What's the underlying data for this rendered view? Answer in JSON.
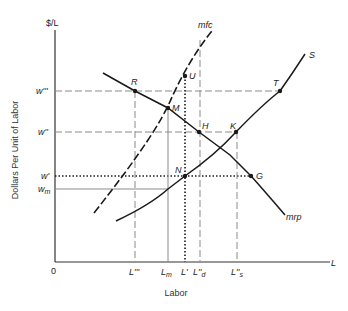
{
  "diagram": {
    "y_axis": {
      "unit_label": "$/L",
      "title": "Dollars Per Unit of Labor"
    },
    "x_axis": {
      "end_label": "L",
      "origin_label": "0",
      "title": "Labor"
    },
    "wage_ticks": [
      {
        "id": "w3",
        "label": "w'''",
        "y": 91
      },
      {
        "id": "w2",
        "label": "w''",
        "y": 132
      },
      {
        "id": "w1",
        "label": "w'",
        "y": 176
      },
      {
        "id": "wm",
        "label": "w",
        "sub": "m",
        "y": 189
      }
    ],
    "labor_ticks": [
      {
        "id": "L3",
        "label": "L'''",
        "x": 135
      },
      {
        "id": "Lm",
        "label": "L",
        "sub": "m",
        "x": 168
      },
      {
        "id": "L1",
        "label": "L'",
        "x": 185
      },
      {
        "id": "Ld",
        "label": "L''",
        "sub": "d",
        "x": 200
      },
      {
        "id": "Ls",
        "label": "L''",
        "sub": "s",
        "x": 237
      }
    ],
    "curves": [
      {
        "id": "mrp",
        "label": "mrp",
        "style": "solid"
      },
      {
        "id": "mfc",
        "label": "mfc",
        "style": "dashed"
      },
      {
        "id": "S",
        "label": "S",
        "style": "solid"
      }
    ],
    "points": [
      {
        "label": "R",
        "x": 135,
        "y": 91
      },
      {
        "label": "M",
        "x": 168,
        "y": 108
      },
      {
        "label": "U",
        "x": 185,
        "y": 76
      },
      {
        "label": "H",
        "x": 199,
        "y": 132
      },
      {
        "label": "K",
        "x": 236,
        "y": 132
      },
      {
        "label": "T",
        "x": 280,
        "y": 91
      },
      {
        "label": "N",
        "x": 185,
        "y": 176
      },
      {
        "label": "G",
        "x": 251,
        "y": 176
      }
    ],
    "colors": {
      "line": "#1a1a1a",
      "guide": "#8a8a8a",
      "axis": "#333333"
    }
  }
}
